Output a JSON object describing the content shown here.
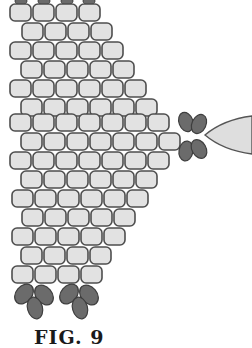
{
  "figure": {
    "caption": "FIG. 9",
    "colors": {
      "background": "#ffffff",
      "bead_fill": "#e2e2e2",
      "bead_stroke": "#4e4e4e",
      "dark_bead_fill": "#6b6b6b",
      "dark_bead_stroke": "#3e3e3e",
      "dagger_fill": "#dedede",
      "dagger_stroke": "#555555"
    },
    "bead": {
      "width": 21,
      "height": 17,
      "radius": 5,
      "pitch_x": 23
    },
    "rows": [
      {
        "y": 4,
        "x0": 10,
        "count": 4
      },
      {
        "y": 23,
        "x0": 22,
        "count": 4
      },
      {
        "y": 42,
        "x0": 10,
        "count": 5
      },
      {
        "y": 61,
        "x0": 21,
        "count": 5
      },
      {
        "y": 80,
        "x0": 10,
        "count": 6
      },
      {
        "y": 99,
        "x0": 21,
        "count": 6
      },
      {
        "y": 114,
        "x0": 10,
        "count": 7
      },
      {
        "y": 133,
        "x0": 21,
        "count": 7
      },
      {
        "y": 152,
        "x0": 10,
        "count": 7
      },
      {
        "y": 171,
        "x0": 21,
        "count": 6
      },
      {
        "y": 190,
        "x0": 12,
        "count": 6
      },
      {
        "y": 209,
        "x0": 22,
        "count": 5
      },
      {
        "y": 228,
        "x0": 12,
        "count": 5
      },
      {
        "y": 247,
        "x0": 21,
        "count": 4
      },
      {
        "y": 266,
        "x0": 12,
        "count": 4
      }
    ],
    "top_stubs": [
      {
        "x": 21
      },
      {
        "x": 44
      },
      {
        "x": 67
      },
      {
        "x": 89
      }
    ],
    "dark_beads": [
      {
        "cx": 186,
        "cy": 122,
        "rx": 7,
        "ry": 10,
        "rot": -20
      },
      {
        "cx": 199,
        "cy": 124,
        "rx": 7,
        "ry": 10,
        "rot": 25
      },
      {
        "cx": 186,
        "cy": 151,
        "rx": 7,
        "ry": 10,
        "rot": 10
      },
      {
        "cx": 199,
        "cy": 149,
        "rx": 7,
        "ry": 10,
        "rot": -30
      },
      {
        "cx": 24,
        "cy": 294,
        "rx": 8,
        "ry": 11,
        "rot": 40
      },
      {
        "cx": 44,
        "cy": 295,
        "rx": 8,
        "ry": 11,
        "rot": -40
      },
      {
        "cx": 35,
        "cy": 308,
        "rx": 7.5,
        "ry": 11,
        "rot": -15
      },
      {
        "cx": 69,
        "cy": 294,
        "rx": 8,
        "ry": 11,
        "rot": 40
      },
      {
        "cx": 89,
        "cy": 295,
        "rx": 8,
        "ry": 11,
        "rot": -40
      },
      {
        "cx": 80,
        "cy": 308,
        "rx": 7.5,
        "ry": 11,
        "rot": -15
      }
    ],
    "dagger": {
      "path": "M205,135 C218,124 236,118 252,116 L252,154 C236,152 218,146 205,135 Z"
    }
  }
}
